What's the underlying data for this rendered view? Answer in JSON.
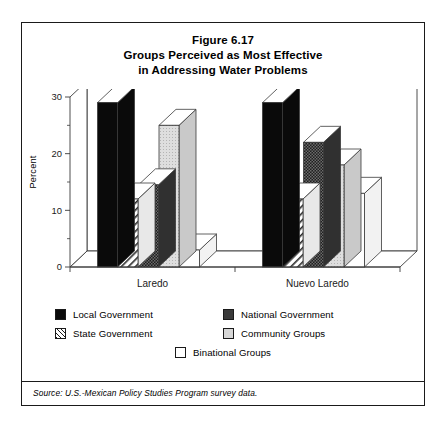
{
  "figure": {
    "title_lines": [
      "Figure 6.17",
      "Groups Perceived as Most Effective",
      "in Addressing Water Problems"
    ],
    "source_note": "Source:  U.S.-Mexican Policy Studies Program survey data."
  },
  "legend": {
    "items": [
      {
        "label": "Local Government",
        "swatch": "black"
      },
      {
        "label": "National Government",
        "swatch": "dark-checker"
      },
      {
        "label": "State Government",
        "swatch": "diagonal-hatch"
      },
      {
        "label": "Community Groups",
        "swatch": "light-gray"
      },
      {
        "label": "Binational Groups",
        "swatch": "white"
      }
    ]
  },
  "chart_data": {
    "type": "bar",
    "title": "Groups Perceived as Most Effective in Addressing Water Problems",
    "xlabel": "",
    "ylabel": "Percent",
    "ylim": [
      0,
      30
    ],
    "yticks": [
      0,
      10,
      20,
      30
    ],
    "yminorticks": [
      5,
      15,
      25
    ],
    "grid": false,
    "legend_position": "below",
    "style": "3d-isometric",
    "categories": [
      "Laredo",
      "Nuevo Laredo"
    ],
    "series": [
      {
        "name": "Local Government",
        "values": [
          29,
          29
        ],
        "color": "#0a0a0a"
      },
      {
        "name": "State Government",
        "values": [
          12,
          12
        ],
        "color": "#ffffff"
      },
      {
        "name": "National Government",
        "values": [
          14.5,
          22
        ],
        "color": "#3a3a3a"
      },
      {
        "name": "Community Groups",
        "values": [
          25,
          18
        ],
        "color": "#d6d6d6"
      },
      {
        "name": "Binational Groups",
        "values": [
          3,
          13
        ],
        "color": "#ffffff"
      }
    ]
  }
}
